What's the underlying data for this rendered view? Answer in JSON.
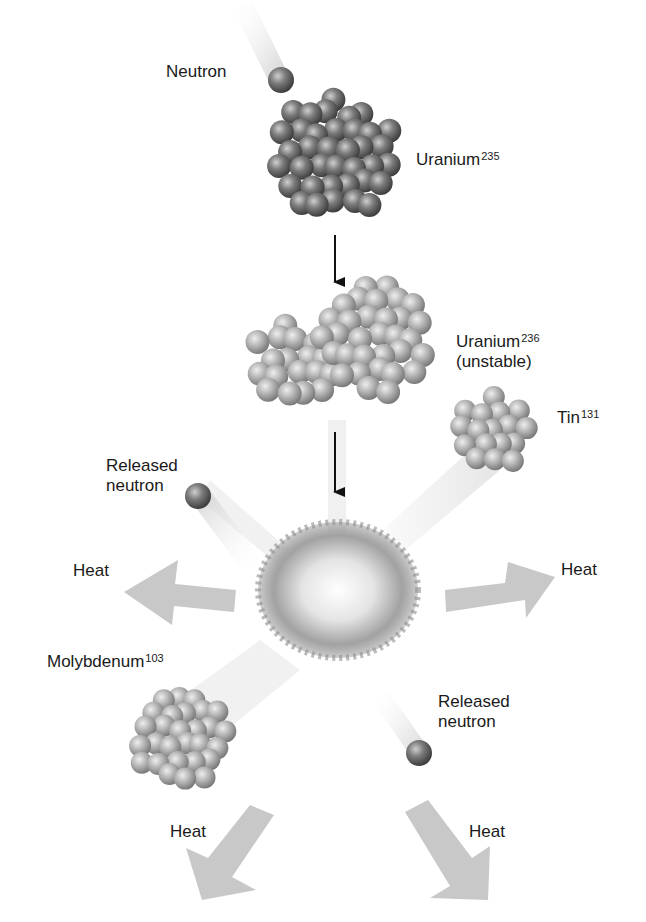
{
  "diagram": {
    "labels": {
      "incoming_neutron": "Neutron",
      "uranium235": {
        "name": "Uranium",
        "mass": "235"
      },
      "uranium236": {
        "name": "Uranium",
        "mass": "236",
        "note": "(unstable)"
      },
      "tin131": {
        "name": "Tin",
        "mass": "131"
      },
      "molybdenum103": {
        "name": "Molybdenum",
        "mass": "103"
      },
      "released_neutron_1": {
        "line1": "Released",
        "line2": "neutron"
      },
      "released_neutron_2": {
        "line1": "Released",
        "line2": "neutron"
      },
      "heat_left": "Heat",
      "heat_right": "Heat",
      "heat_bottom_left": "Heat",
      "heat_bottom_right": "Heat"
    },
    "colors": {
      "nucleon_dark": "#6e6e6e",
      "nucleon_light": "#b5b5b5",
      "heat_arrow": "#c8c8c8",
      "arrow": "#111111"
    }
  }
}
